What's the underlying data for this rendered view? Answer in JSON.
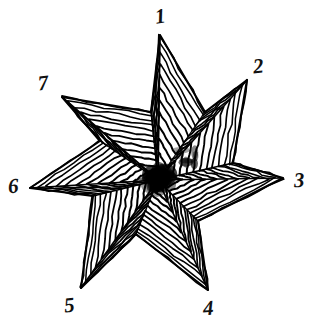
{
  "figure": {
    "background_color": "#ffffff",
    "ink_color": "#000000",
    "width": 316,
    "height": 333,
    "style": "hand-drawn ink line art",
    "center": {
      "x": 158,
      "y": 180
    },
    "point_count": 7,
    "line_bands_per_point": 13
  },
  "chart_data": {
    "type": "scatter",
    "subtitle": "",
    "xlabel": "",
    "ylabel": "",
    "grid": false,
    "legend": false,
    "xlim": [
      0,
      316
    ],
    "ylim": [
      0,
      333
    ],
    "center": {
      "x": 158,
      "y": 180
    },
    "categories": [
      "1",
      "2",
      "3",
      "4",
      "5",
      "6",
      "7"
    ],
    "values": [
      1,
      2,
      3,
      4,
      5,
      6,
      7
    ],
    "series": [
      {
        "name": "star tips",
        "points": [
          {
            "label": "1",
            "x": 160,
            "y": 35,
            "angle_deg": 90,
            "radius": 145
          },
          {
            "label": "2",
            "x": 247,
            "y": 80,
            "angle_deg": 39,
            "radius": 135
          },
          {
            "label": "3",
            "x": 283,
            "y": 178,
            "angle_deg": 1,
            "radius": 125
          },
          {
            "label": "4",
            "x": 208,
            "y": 290,
            "angle_deg": -66,
            "radius": 121
          },
          {
            "label": "5",
            "x": 81,
            "y": 288,
            "angle_deg": -124,
            "radius": 134
          },
          {
            "label": "6",
            "x": 30,
            "y": 188,
            "angle_deg": 176,
            "radius": 128
          },
          {
            "label": "7",
            "x": 62,
            "y": 97,
            "angle_deg": 136,
            "radius": 133
          }
        ]
      },
      {
        "name": "inner vertices",
        "points": [
          {
            "x": 205,
            "y": 112
          },
          {
            "x": 233,
            "y": 163
          },
          {
            "x": 198,
            "y": 221
          },
          {
            "x": 136,
            "y": 234
          },
          {
            "x": 93,
            "y": 196
          },
          {
            "x": 100,
            "y": 141
          },
          {
            "x": 151,
            "y": 112
          }
        ]
      }
    ]
  },
  "labels": [
    {
      "id": "point-label-1",
      "text": "1",
      "x": 155,
      "y": 6,
      "rotate": -8
    },
    {
      "id": "point-label-2",
      "text": "2",
      "x": 253,
      "y": 56,
      "rotate": -6
    },
    {
      "id": "point-label-3",
      "text": "3",
      "x": 294,
      "y": 170,
      "rotate": -3
    },
    {
      "id": "point-label-4",
      "text": "4",
      "x": 203,
      "y": 298,
      "rotate": -4
    },
    {
      "id": "point-label-5",
      "text": "5",
      "x": 64,
      "y": 295,
      "rotate": -6
    },
    {
      "id": "point-label-6",
      "text": "6",
      "x": 8,
      "y": 176,
      "rotate": -4
    },
    {
      "id": "point-label-7",
      "text": "7",
      "x": 38,
      "y": 73,
      "rotate": -7
    }
  ]
}
